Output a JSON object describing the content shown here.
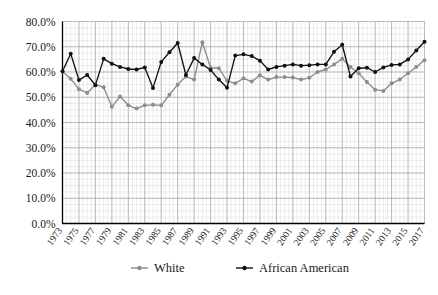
{
  "chart_data": {
    "type": "line",
    "title": "",
    "subtitle": "",
    "xlabel": "",
    "ylabel": "",
    "ylim": [
      0,
      0.8
    ],
    "ytick_labels": [
      "0.0%",
      "10.0%",
      "20.0%",
      "30.0%",
      "40.0%",
      "50.0%",
      "60.0%",
      "70.0%",
      "80.0%"
    ],
    "ytick_values": [
      0,
      10,
      20,
      30,
      40,
      50,
      60,
      70,
      80
    ],
    "grid": true,
    "grid_minor": true,
    "legend_position": "bottom",
    "x": [
      1973,
      1974,
      1975,
      1976,
      1977,
      1978,
      1979,
      1980,
      1981,
      1982,
      1983,
      1984,
      1985,
      1986,
      1987,
      1988,
      1989,
      1990,
      1991,
      1992,
      1993,
      1994,
      1995,
      1996,
      1997,
      1998,
      1999,
      2000,
      2001,
      2002,
      2003,
      2004,
      2005,
      2006,
      2007,
      2008,
      2009,
      2010,
      2011,
      2012,
      2013,
      2014,
      2015,
      2016,
      2017
    ],
    "xtick_labels": [
      "1973",
      "1975",
      "1977",
      "1979",
      "1981",
      "1983",
      "1985",
      "1987",
      "1989",
      "1991",
      "1993",
      "1995",
      "1997",
      "1999",
      "2001",
      "2003",
      "2005",
      "2007",
      "2009",
      "2011",
      "2013",
      "2015",
      "2017"
    ],
    "xtick_values": [
      1973,
      1975,
      1977,
      1979,
      1981,
      1983,
      1985,
      1987,
      1989,
      1991,
      1993,
      1995,
      1997,
      1999,
      2001,
      2003,
      2005,
      2007,
      2009,
      2011,
      2013,
      2015,
      2017
    ],
    "series": [
      {
        "name": "White",
        "color": "#8c8c8c",
        "marker": "circle",
        "values": [
          60.2,
          57.3,
          53.2,
          51.7,
          55.0,
          54.0,
          46.2,
          50.3,
          46.8,
          45.5,
          46.8,
          47.0,
          46.8,
          51.0,
          55.0,
          58.2,
          57.0,
          71.8,
          61.7,
          61.5,
          56.5,
          55.5,
          57.5,
          56.2,
          58.7,
          57.0,
          58.0,
          58.0,
          57.8,
          57.0,
          57.7,
          60.0,
          61.0,
          63.0,
          65.2,
          62.0,
          59.5,
          56.0,
          53.0,
          52.5,
          55.5,
          57.0,
          59.5,
          62.0,
          64.7
        ]
      },
      {
        "name": "African American",
        "color": "#111111",
        "marker": "circle",
        "values": [
          60.3,
          67.2,
          56.8,
          58.8,
          54.8,
          65.2,
          63.3,
          62.0,
          61.2,
          61.0,
          61.8,
          53.7,
          64.0,
          67.8,
          71.5,
          58.8,
          65.5,
          63.0,
          60.8,
          57.0,
          53.8,
          66.5,
          67.0,
          66.3,
          64.5,
          61.0,
          62.0,
          62.5,
          63.0,
          62.5,
          62.7,
          63.0,
          63.0,
          68.0,
          70.8,
          58.2,
          61.5,
          61.7,
          60.0,
          61.8,
          62.8,
          63.0,
          65.0,
          68.5,
          72.0
        ]
      }
    ]
  },
  "legend": {
    "items": [
      {
        "label": "White",
        "color": "#8c8c8c"
      },
      {
        "label": "African American",
        "color": "#111111"
      }
    ]
  }
}
